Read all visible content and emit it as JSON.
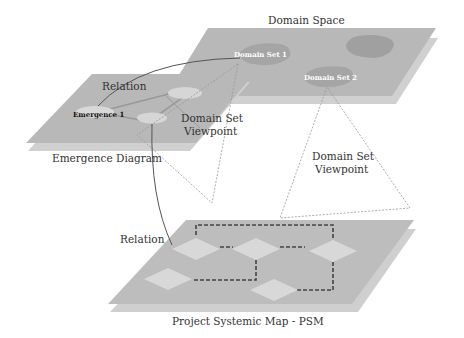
{
  "diagram": {
    "layers": {
      "domain_space": {
        "label": "Domain Space"
      },
      "emergence_diagram": {
        "label": "Emergence Diagram"
      },
      "psm": {
        "label": "Project Systemic Map - PSM"
      }
    },
    "nodes": {
      "domain_set_1": "Domain Set 1",
      "domain_set_2": "Domain Set 2",
      "emergence_1": "Emergence 1"
    },
    "annotations": {
      "relation_top": "Relation",
      "relation_bottom": "Relation",
      "viewpoint_left_line1": "Domain Set",
      "viewpoint_left_line2": "Viewpoint",
      "viewpoint_right_line1": "Domain Set",
      "viewpoint_right_line2": "Viewpoint"
    },
    "colors": {
      "plane": "#b5b5b5",
      "plane_shadow": "#cfcfcf",
      "node": "#a8a8a8",
      "node_light": "#d4d4d4",
      "line": "#555555",
      "dashed": "#444444"
    }
  }
}
